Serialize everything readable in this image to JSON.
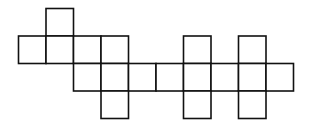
{
  "diagram": {
    "title": "",
    "stroke_color": "#111111",
    "fill_color": "#ffffff",
    "cells": [
      {
        "row": 0,
        "col": 1
      },
      {
        "row": 1,
        "col": 0
      },
      {
        "row": 1,
        "col": 1
      },
      {
        "row": 1,
        "col": 2
      },
      {
        "row": 1,
        "col": 3
      },
      {
        "row": 1,
        "col": 6
      },
      {
        "row": 1,
        "col": 8
      },
      {
        "row": 2,
        "col": 2
      },
      {
        "row": 2,
        "col": 3
      },
      {
        "row": 2,
        "col": 4
      },
      {
        "row": 2,
        "col": 5
      },
      {
        "row": 2,
        "col": 6
      },
      {
        "row": 2,
        "col": 7
      },
      {
        "row": 2,
        "col": 8
      },
      {
        "row": 2,
        "col": 9
      },
      {
        "row": 3,
        "col": 3
      },
      {
        "row": 3,
        "col": 6
      },
      {
        "row": 3,
        "col": 8
      }
    ]
  }
}
